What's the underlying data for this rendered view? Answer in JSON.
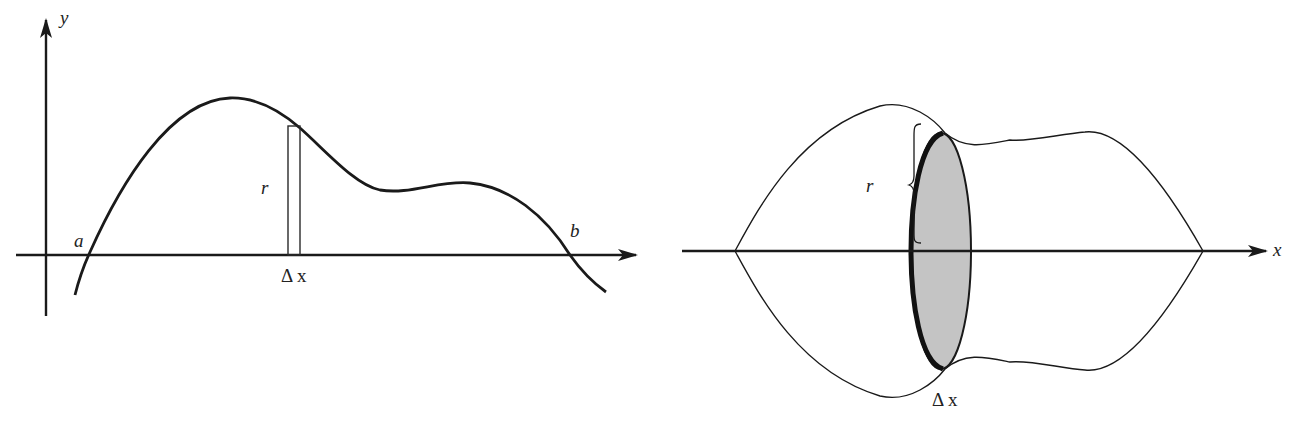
{
  "figure": {
    "left_panel": {
      "title": "Region under curve with thin rectangle",
      "axis_labels": {
        "y": "y"
      },
      "labels": {
        "a": "a",
        "b": "b",
        "r": "r",
        "delta_x": "Δ x"
      }
    },
    "right_panel": {
      "title": "Solid of revolution with disk slice",
      "axis_labels": {
        "x": "x"
      },
      "labels": {
        "r": "r",
        "delta_x": "Δ x"
      },
      "disk_fill_color": "#c4c4c4"
    },
    "colors": {
      "ink": "#1a1a1a",
      "background": "#ffffff"
    }
  }
}
